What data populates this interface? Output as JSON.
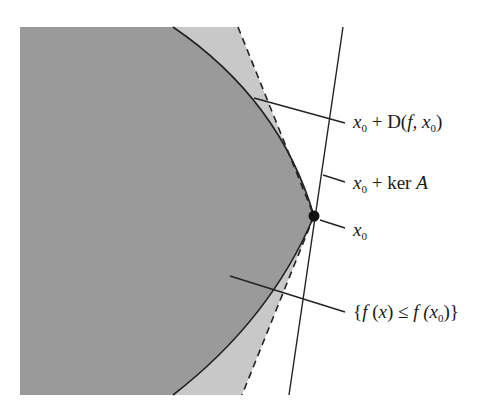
{
  "diagram": {
    "colors": {
      "level_set_fill": "#9a9a9a",
      "cone_fill": "#c8c8c8",
      "background": "#ffffff",
      "stroke": "#222222"
    },
    "labels": {
      "descent_cone": {
        "prefix": "x",
        "sub": "0",
        "rest": " + D(",
        "f": "f",
        "comma": ", x",
        "sub2": "0",
        "close": ")"
      },
      "kernel": {
        "prefix": "x",
        "sub": "0",
        "rest": " + ker ",
        "A": "A"
      },
      "point": {
        "prefix": "x",
        "sub": "0"
      },
      "level_set": {
        "open": "{",
        "f1": "f",
        "mid1": " (",
        "x": "x",
        "mid2": ") ≤ ",
        "f2": "f",
        "mid3": " (x",
        "sub": "0",
        "close": ")}"
      }
    },
    "elements": [
      "level-set-region {f(x) ≤ f(x0)}",
      "descent-cone x0 + D(f, x0) (dashed boundary)",
      "line x0 + ker A",
      "point x0"
    ]
  }
}
